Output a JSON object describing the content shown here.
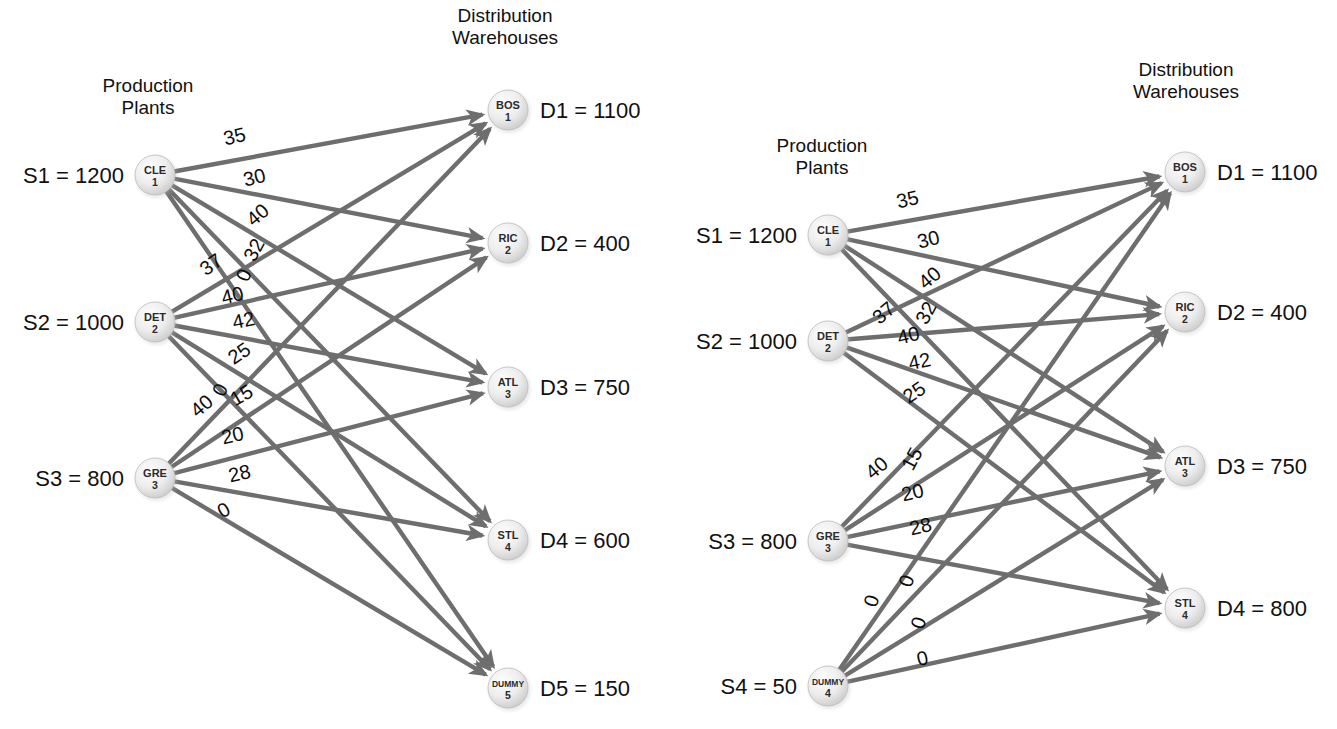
{
  "figure": {
    "background": "#ffffff",
    "edge_color": "#6e6e6e",
    "node_fill": "#e4e4e4",
    "text_color": "#111111"
  },
  "panels": [
    {
      "id": "left",
      "headers": {
        "sources": "Production\nPlants",
        "sources_line1": "Production",
        "sources_line2": "Plants",
        "destinations_line1": "Distribution",
        "destinations_line2": "Warehouses"
      },
      "sources": [
        {
          "code": "CLE",
          "index": "1",
          "label": "S1 = 1200",
          "supply": 1200
        },
        {
          "code": "DET",
          "index": "2",
          "label": "S2 = 1000",
          "supply": 1000
        },
        {
          "code": "GRE",
          "index": "3",
          "label": "S3 = 800",
          "supply": 800
        }
      ],
      "destinations": [
        {
          "code": "BOS",
          "index": "1",
          "label": "D1 = 1100",
          "demand": 1100
        },
        {
          "code": "RIC",
          "index": "2",
          "label": "D2 = 400",
          "demand": 400
        },
        {
          "code": "ATL",
          "index": "3",
          "label": "D3 = 750",
          "demand": 750
        },
        {
          "code": "STL",
          "index": "4",
          "label": "D4 = 600",
          "demand": 600
        },
        {
          "code": "DUMMY",
          "index": "5",
          "label": "D5 = 150",
          "demand": 150
        }
      ],
      "edges": [
        {
          "from": 0,
          "to": 0,
          "cost": "35"
        },
        {
          "from": 0,
          "to": 1,
          "cost": "30"
        },
        {
          "from": 0,
          "to": 2,
          "cost": "40"
        },
        {
          "from": 0,
          "to": 3,
          "cost": "32"
        },
        {
          "from": 0,
          "to": 4,
          "cost": "0"
        },
        {
          "from": 1,
          "to": 0,
          "cost": "37"
        },
        {
          "from": 1,
          "to": 1,
          "cost": "40"
        },
        {
          "from": 1,
          "to": 2,
          "cost": "42"
        },
        {
          "from": 1,
          "to": 3,
          "cost": "25"
        },
        {
          "from": 1,
          "to": 4,
          "cost": "0"
        },
        {
          "from": 2,
          "to": 0,
          "cost": "40"
        },
        {
          "from": 2,
          "to": 1,
          "cost": "15"
        },
        {
          "from": 2,
          "to": 2,
          "cost": "20"
        },
        {
          "from": 2,
          "to": 3,
          "cost": "28"
        },
        {
          "from": 2,
          "to": 4,
          "cost": "0"
        }
      ]
    },
    {
      "id": "right",
      "headers": {
        "sources_line1": "Production",
        "sources_line2": "Plants",
        "destinations_line1": "Distribution",
        "destinations_line2": "Warehouses"
      },
      "sources": [
        {
          "code": "CLE",
          "index": "1",
          "label": "S1 = 1200",
          "supply": 1200
        },
        {
          "code": "DET",
          "index": "2",
          "label": "S2 = 1000",
          "supply": 1000
        },
        {
          "code": "GRE",
          "index": "3",
          "label": "S3 = 800",
          "supply": 800
        },
        {
          "code": "DUMMY",
          "index": "4",
          "label": "S4 = 50",
          "supply": 50
        }
      ],
      "destinations": [
        {
          "code": "BOS",
          "index": "1",
          "label": "D1 = 1100",
          "demand": 1100
        },
        {
          "code": "RIC",
          "index": "2",
          "label": "D2 = 400",
          "demand": 400
        },
        {
          "code": "ATL",
          "index": "3",
          "label": "D3 = 750",
          "demand": 750
        },
        {
          "code": "STL",
          "index": "4",
          "label": "D4 = 800",
          "demand": 800
        }
      ],
      "edges": [
        {
          "from": 0,
          "to": 0,
          "cost": "35"
        },
        {
          "from": 0,
          "to": 1,
          "cost": "30"
        },
        {
          "from": 0,
          "to": 2,
          "cost": "40"
        },
        {
          "from": 0,
          "to": 3,
          "cost": "32"
        },
        {
          "from": 1,
          "to": 0,
          "cost": "37"
        },
        {
          "from": 1,
          "to": 1,
          "cost": "40"
        },
        {
          "from": 1,
          "to": 2,
          "cost": "42"
        },
        {
          "from": 1,
          "to": 3,
          "cost": "25"
        },
        {
          "from": 2,
          "to": 0,
          "cost": "40"
        },
        {
          "from": 2,
          "to": 1,
          "cost": "15"
        },
        {
          "from": 2,
          "to": 2,
          "cost": "20"
        },
        {
          "from": 2,
          "to": 3,
          "cost": "28"
        },
        {
          "from": 3,
          "to": 0,
          "cost": "0"
        },
        {
          "from": 3,
          "to": 1,
          "cost": "0"
        },
        {
          "from": 3,
          "to": 2,
          "cost": "0"
        },
        {
          "from": 3,
          "to": 3,
          "cost": "0"
        }
      ]
    }
  ]
}
